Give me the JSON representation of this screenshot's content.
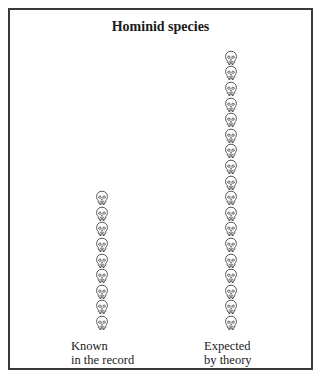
{
  "figure": {
    "title": "Hominid species",
    "icon": "skull-icon",
    "border_color": "#3a3a3a",
    "columns": [
      {
        "id": "known",
        "label_line1": "Known",
        "label_line2": "in the record",
        "count": 9
      },
      {
        "id": "expected",
        "label_line1": "Expected",
        "label_line2": "by theory",
        "count": 18
      }
    ]
  }
}
